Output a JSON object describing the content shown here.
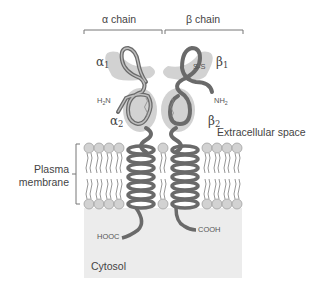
{
  "header": {
    "alpha_chain": "α chain",
    "beta_chain": "β chain"
  },
  "domains": {
    "alpha1": {
      "sym": "α",
      "sub": "1"
    },
    "alpha2": {
      "sym": "α",
      "sub": "2"
    },
    "beta1": {
      "sym": "β",
      "sub": "1"
    },
    "beta2": {
      "sym": "β",
      "sub": "2"
    }
  },
  "termini": {
    "h2n": {
      "a": "H",
      "sub": "2",
      "b": "N"
    },
    "nh2": {
      "a": "NH",
      "sub": "2"
    },
    "hooc": "HOOC",
    "cooh": "COOH"
  },
  "bonds": {
    "ss_beta1": "S-S",
    "ss_alpha2": "S S",
    "ss_beta2": "S S"
  },
  "regions": {
    "extracellular": "Extracellular space",
    "membrane_line1": "Plasma",
    "membrane_line2": "membrane",
    "cytosol": "Cytosol"
  },
  "colors": {
    "domain_fill": "#cfcfcf",
    "chain_stroke": "#6a6a6a",
    "cytosol_fill": "#ececec",
    "lipid_head": "#d2d2d2",
    "bracket": "#777777"
  }
}
